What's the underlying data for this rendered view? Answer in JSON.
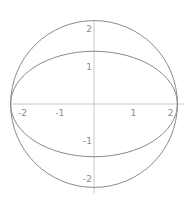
{
  "chart_data": {
    "type": "line",
    "title": "",
    "xlabel": "",
    "ylabel": "",
    "xlim": [
      -2.25,
      2.4
    ],
    "ylim": [
      -2.4,
      2.25
    ],
    "grid": false,
    "x_ticks": [
      {
        "value": -2,
        "label": "-2"
      },
      {
        "value": -1,
        "label": "-1"
      },
      {
        "value": 1,
        "label": "1"
      },
      {
        "value": 2,
        "label": "2"
      }
    ],
    "y_ticks": [
      {
        "value": 2,
        "label": "2"
      },
      {
        "value": 1,
        "label": "1"
      },
      {
        "value": -1,
        "label": "-1"
      },
      {
        "value": -2,
        "label": "-2"
      }
    ],
    "series": [
      {
        "name": "circle",
        "shape": "ellipse",
        "center": [
          0,
          0
        ],
        "rx": 2.236,
        "ry": 2.236,
        "color": "#8a8a8a"
      },
      {
        "name": "ellipse",
        "shape": "ellipse",
        "center": [
          0,
          0
        ],
        "rx": 2.236,
        "ry": 1.414,
        "color": "#8a8a8a"
      }
    ]
  }
}
